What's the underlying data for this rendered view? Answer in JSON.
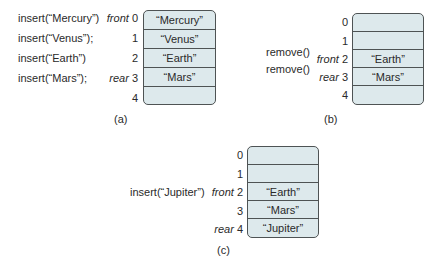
{
  "panels": [
    {
      "id": "a",
      "caption": "(a)",
      "operations": [
        "insert(“Mercury”)",
        "insert(“Venus”);",
        "insert(“Earth”)",
        "insert(“Mars”);"
      ],
      "indices": [
        {
          "pointer": "front",
          "index": "0"
        },
        {
          "pointer": "",
          "index": "1"
        },
        {
          "pointer": "",
          "index": "2"
        },
        {
          "pointer": "rear",
          "index": "3"
        },
        {
          "pointer": "",
          "index": "4"
        }
      ],
      "cells": [
        "“Mercury”",
        "“Venus”",
        "“Earth”",
        "“Mars”",
        ""
      ]
    },
    {
      "id": "b",
      "caption": "(b)",
      "operations": [
        "remove()",
        "remove()"
      ],
      "indices": [
        {
          "pointer": "",
          "index": "0"
        },
        {
          "pointer": "",
          "index": "1"
        },
        {
          "pointer": "front",
          "index": "2"
        },
        {
          "pointer": "rear",
          "index": "3"
        },
        {
          "pointer": "",
          "index": "4"
        }
      ],
      "cells": [
        "",
        "",
        "“Earth”",
        "“Mars”",
        ""
      ]
    },
    {
      "id": "c",
      "caption": "(c)",
      "operations": [
        "insert(“Jupiter”)"
      ],
      "indices": [
        {
          "pointer": "",
          "index": "0"
        },
        {
          "pointer": "",
          "index": "1"
        },
        {
          "pointer": "front",
          "index": "2"
        },
        {
          "pointer": "",
          "index": "3"
        },
        {
          "pointer": "rear",
          "index": "4"
        }
      ],
      "cells": [
        "",
        "",
        "“Earth”",
        "“Mars”",
        "“Jupiter”"
      ]
    }
  ],
  "colors": {
    "cell_fill": "#dde9ec",
    "border": "#4e5354",
    "text": "#2a2a2a"
  }
}
